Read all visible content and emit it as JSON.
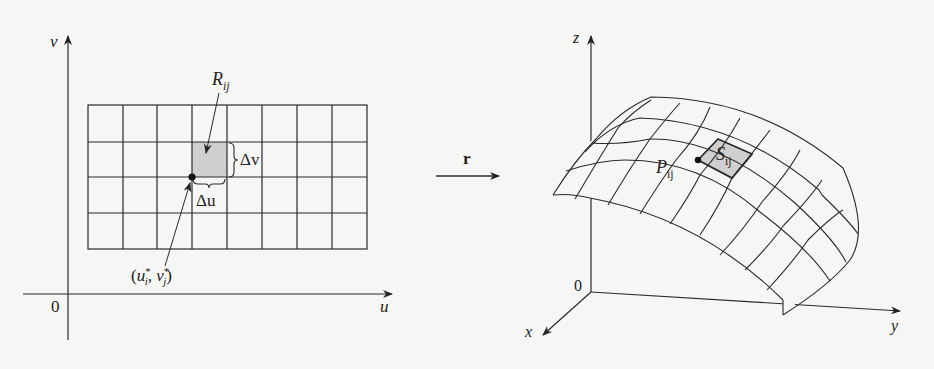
{
  "left_panel": {
    "axes": {
      "vertical_label": "v",
      "horizontal_label": "u",
      "origin_label": "0"
    },
    "grid": {
      "columns": 8,
      "rows": 4
    },
    "highlighted_cell": {
      "label_main": "R",
      "label_sub": "ij",
      "fill": "#cfcfcf"
    },
    "delta_v_label": "Δv",
    "delta_u_label": "Δu",
    "sample_point": {
      "open": "(",
      "u": "u",
      "u_sup": "*",
      "u_sub": "i",
      "sep": ", ",
      "v": "v",
      "v_sup": "*",
      "v_sub": "j",
      "close": ")"
    }
  },
  "mapping_arrow": {
    "label": "r"
  },
  "right_panel": {
    "axes": {
      "z_label": "z",
      "y_label": "y",
      "x_label": "x",
      "origin_label": "0"
    },
    "point_label": {
      "main": "P",
      "sub": "ij"
    },
    "patch_label": {
      "main": "S",
      "sub": "ij",
      "fill": "#cfcfcf"
    }
  },
  "colors": {
    "line": "#2a2a2a",
    "shade": "#cfcfcf",
    "background": "#f6f6f4"
  }
}
